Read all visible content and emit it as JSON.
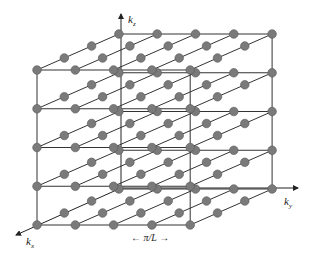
{
  "figure": {
    "axes": {
      "kx": {
        "label": "k",
        "subscript": "x"
      },
      "ky": {
        "label": "k",
        "subscript": "y"
      },
      "kz": {
        "label": "k",
        "subscript": "z"
      }
    },
    "spacing_label": {
      "left_arrow": "←",
      "text": "π/L",
      "right_arrow": "→"
    },
    "lattice": {
      "nx": 4,
      "ny": 5,
      "nz": 5,
      "origin": [
        37,
        225
      ],
      "step_ky": [
        38.3,
        0
      ],
      "step_kz": [
        0,
        -38.75
      ],
      "step_kx": [
        27.3,
        -12.0
      ]
    },
    "colors": {
      "node_fill": "#7a7a7a",
      "node_stroke": "#555555",
      "line": "#333333",
      "background": "#ffffff"
    }
  }
}
